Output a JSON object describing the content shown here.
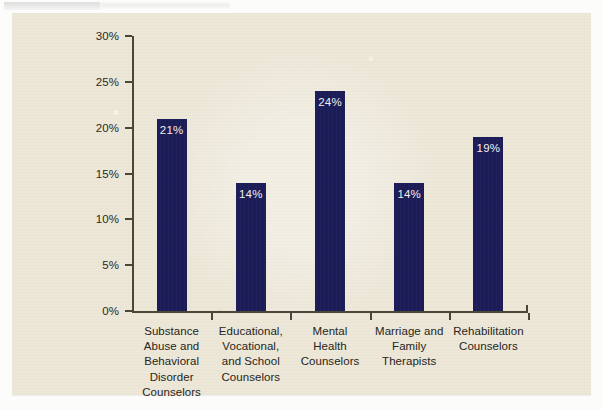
{
  "chart_data": {
    "type": "bar",
    "title": "",
    "subtitle": "",
    "xlabel": "",
    "ylabel": "",
    "ylim": [
      0,
      30
    ],
    "yticks": [
      "0%",
      "5%",
      "10%",
      "15%",
      "20%",
      "25%",
      "30%"
    ],
    "ytick_values": [
      0,
      5,
      10,
      15,
      20,
      25,
      30
    ],
    "grid": false,
    "legend": "none",
    "categories": [
      "Substance Abuse and Behavioral Disorder Counselors",
      "Educational, Vocational, and School Counselors",
      "Mental Health Counselors",
      "Marriage and Family Therapists",
      "Rehabilitation Counselors"
    ],
    "category_lines": [
      [
        "Substance",
        "Abuse and",
        "Behavioral",
        "Disorder",
        "Counselors"
      ],
      [
        "Educational,",
        "Vocational,",
        "and School",
        "Counselors"
      ],
      [
        "Mental",
        "Health",
        "Counselors"
      ],
      [
        "Marriage and",
        "Family",
        "Therapists"
      ],
      [
        "Rehabilitation",
        "Counselors"
      ]
    ],
    "values": [
      21,
      14,
      24,
      14,
      19
    ],
    "value_labels": [
      "21%",
      "14%",
      "24%",
      "14%",
      "19%"
    ],
    "colors": {
      "bar": "#1c1c58",
      "bar_label_text": "#f3f1e8",
      "axis": "#4a4637",
      "background": "#ece7d7",
      "page": "#fcfcfb",
      "text": "#262420"
    }
  }
}
